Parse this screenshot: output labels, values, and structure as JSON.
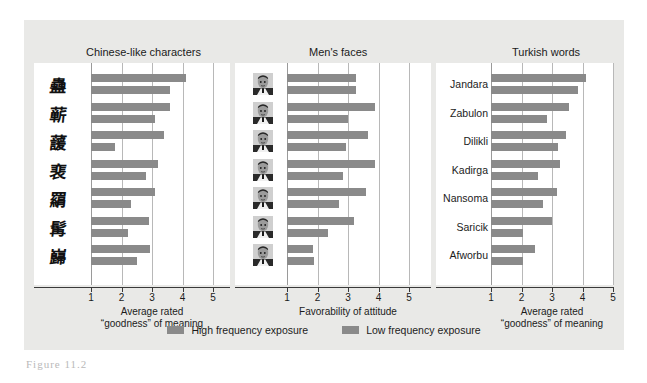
{
  "figure": {
    "caption": "Figure 11.2",
    "background_color": "#e9e9e7",
    "bar_color": "#8a8a8a"
  },
  "legend": {
    "items": [
      {
        "label": "High frequency exposure",
        "color": "#8a8a8a",
        "series": "high"
      },
      {
        "label": "Low frequency exposure",
        "color": "#8a8a8a",
        "series": "low"
      }
    ]
  },
  "chart_data": [
    {
      "type": "bar",
      "orientation": "horizontal",
      "title": "Chinese-like characters",
      "xlabel": "Average rated\n\"goodness\" of meaning",
      "xlabel_line1": "Average rated",
      "xlabel_line2": "“goodness” of meaning",
      "ylabel": "",
      "xlim": [
        1,
        5
      ],
      "ticks": [
        1,
        2,
        3,
        4,
        5
      ],
      "tick_labels": [
        "1",
        "2",
        "3",
        "4",
        "5"
      ],
      "grid": true,
      "legend_position": "bottom",
      "categories": [
        "char-1",
        "char-2",
        "char-3",
        "char-4",
        "char-5",
        "char-6",
        "char-7"
      ],
      "category_glyphs": [
        "蠱",
        "蕲",
        "蘐",
        "裵",
        "羂",
        "髯",
        "巋"
      ],
      "series": [
        {
          "name": "High frequency exposure",
          "values": [
            4.1,
            3.6,
            3.4,
            3.2,
            3.1,
            2.9,
            2.95
          ]
        },
        {
          "name": "Low frequency exposure",
          "values": [
            3.6,
            3.1,
            1.8,
            2.8,
            2.3,
            2.2,
            2.5
          ]
        }
      ]
    },
    {
      "type": "bar",
      "orientation": "horizontal",
      "title": "Men's faces",
      "xlabel": "Favorability of attitude",
      "xlabel_line1": "Favorability of attitude",
      "xlabel_line2": "",
      "ylabel": "",
      "xlim": [
        1,
        5
      ],
      "ticks": [
        1,
        2,
        3,
        4,
        5
      ],
      "tick_labels": [
        "1",
        "2",
        "3",
        "4",
        "5"
      ],
      "grid": true,
      "legend_position": "bottom",
      "categories": [
        "face-1",
        "face-2",
        "face-3",
        "face-4",
        "face-5",
        "face-6",
        "face-7"
      ],
      "series": [
        {
          "name": "High frequency exposure",
          "values": [
            3.25,
            3.9,
            3.65,
            3.9,
            3.6,
            3.2,
            1.85
          ]
        },
        {
          "name": "Low frequency exposure",
          "values": [
            3.25,
            3.0,
            2.95,
            2.85,
            2.7,
            2.35,
            1.9
          ]
        }
      ]
    },
    {
      "type": "bar",
      "orientation": "horizontal",
      "title": "Turkish words",
      "xlabel": "Average rated\n\"goodness\" of meaning",
      "xlabel_line1": "Average rated",
      "xlabel_line2": "“goodness” of meaning",
      "ylabel": "",
      "xlim": [
        1,
        5
      ],
      "ticks": [
        1,
        2,
        3,
        4,
        5
      ],
      "tick_labels": [
        "1",
        "2",
        "3",
        "4",
        "5"
      ],
      "grid": true,
      "legend_position": "bottom",
      "categories": [
        "Jandara",
        "Zabulon",
        "Dilikli",
        "Kadirga",
        "Nansoma",
        "Saricik",
        "Afworbu"
      ],
      "series": [
        {
          "name": "High frequency exposure",
          "values": [
            4.1,
            3.55,
            3.45,
            3.25,
            3.15,
            3.0,
            2.45
          ]
        },
        {
          "name": "Low frequency exposure",
          "values": [
            3.85,
            2.85,
            3.2,
            2.55,
            2.7,
            2.05,
            2.05
          ]
        }
      ]
    }
  ]
}
